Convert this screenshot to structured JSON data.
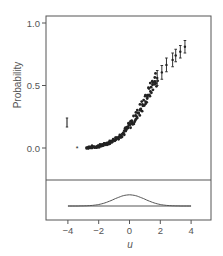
{
  "chart_data": {
    "type": "scatter",
    "title": "",
    "xlabel": "u",
    "ylabel": "Probability",
    "xlim": [
      -5.3,
      5.3
    ],
    "ylim": [
      -0.3,
      1.06
    ],
    "xticks": [
      -4,
      -2,
      0,
      2,
      4
    ],
    "xtick_labels": [
      "−4",
      "−2",
      "0",
      "2",
      "4"
    ],
    "yticks": [
      0.0,
      0.5,
      1.0
    ],
    "ytick_labels": [
      "0.0",
      "0.5",
      "1.0"
    ],
    "grid": false,
    "legend": {
      "symbol": "error-bar",
      "position": "left-middle",
      "label": ""
    },
    "series": [
      {
        "name": "estimated probability",
        "marker": "star",
        "points": [
          {
            "u": -3.4,
            "p": 0.0
          },
          {
            "u": -2.7,
            "p": 0.005
          },
          {
            "u": -2.5,
            "p": 0.007
          },
          {
            "u": -2.3,
            "p": 0.01
          },
          {
            "u": -2.0,
            "p": 0.015
          },
          {
            "u": -1.8,
            "p": 0.02
          },
          {
            "u": -1.6,
            "p": 0.03
          },
          {
            "u": -1.4,
            "p": 0.04
          },
          {
            "u": -1.2,
            "p": 0.05
          },
          {
            "u": -1.0,
            "p": 0.065
          },
          {
            "u": -0.8,
            "p": 0.08
          },
          {
            "u": -0.6,
            "p": 0.1
          },
          {
            "u": -0.4,
            "p": 0.12
          },
          {
            "u": -0.2,
            "p": 0.15
          },
          {
            "u": 0.0,
            "p": 0.18
          },
          {
            "u": 0.2,
            "p": 0.21
          },
          {
            "u": 0.4,
            "p": 0.25
          },
          {
            "u": 0.6,
            "p": 0.29
          },
          {
            "u": 0.8,
            "p": 0.33
          },
          {
            "u": 1.0,
            "p": 0.38
          },
          {
            "u": 1.2,
            "p": 0.43
          },
          {
            "u": 1.4,
            "p": 0.48
          },
          {
            "u": 1.6,
            "p": 0.53
          },
          {
            "u": 1.8,
            "p": 0.56
          },
          {
            "u": 2.1,
            "p": 0.6
          },
          {
            "u": 2.4,
            "p": 0.66
          },
          {
            "u": 2.8,
            "p": 0.7
          },
          {
            "u": 3.0,
            "p": 0.74
          },
          {
            "u": 3.3,
            "p": 0.77
          },
          {
            "u": 3.6,
            "p": 0.81
          }
        ],
        "error_bars": [
          {
            "u": 1.8,
            "low": 0.5,
            "high": 0.62
          },
          {
            "u": 2.1,
            "low": 0.55,
            "high": 0.66
          },
          {
            "u": 2.4,
            "low": 0.61,
            "high": 0.72
          },
          {
            "u": 2.8,
            "low": 0.65,
            "high": 0.76
          },
          {
            "u": 3.0,
            "low": 0.69,
            "high": 0.79
          },
          {
            "u": 3.3,
            "low": 0.72,
            "high": 0.82
          },
          {
            "u": 3.6,
            "low": 0.76,
            "high": 0.86
          }
        ]
      },
      {
        "name": "density of u",
        "type": "line",
        "panel": "bottom",
        "x": [
          -4,
          -3,
          -2,
          -1,
          0,
          1,
          2,
          3,
          4
        ],
        "y": [
          0.0001,
          0.004,
          0.054,
          0.242,
          0.399,
          0.242,
          0.054,
          0.004,
          0.0001
        ]
      }
    ]
  }
}
